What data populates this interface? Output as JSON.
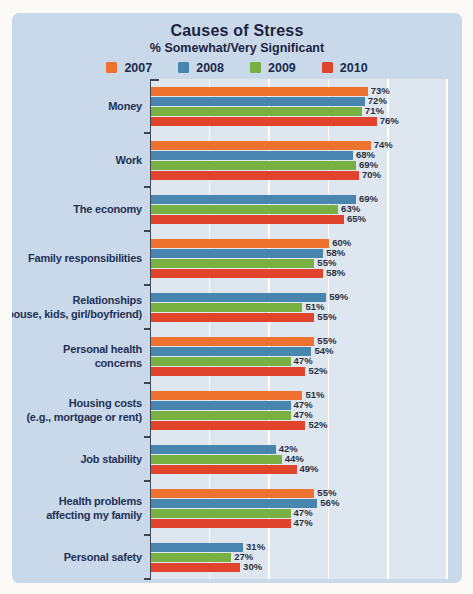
{
  "panel": {
    "background_color": "#c9d9ea",
    "plot_background_color": "#dee7f0"
  },
  "chart_data": {
    "type": "bar",
    "orientation": "horizontal",
    "title": "Causes of Stress",
    "subtitle": "% Somewhat/Very Significant",
    "legend_position": "top",
    "legend_entries": [
      "2007",
      "2008",
      "2009",
      "2010"
    ],
    "xlim": [
      0,
      100
    ],
    "gridline_interval_pct": 20,
    "grid": "on",
    "grid_color": "#ffffff",
    "axis_color": "#40454f",
    "value_suffix": "%",
    "series": [
      {
        "name": "2007",
        "color": "#EF712E"
      },
      {
        "name": "2008",
        "color": "#4986AF"
      },
      {
        "name": "2009",
        "color": "#78B042"
      },
      {
        "name": "2010",
        "color": "#E0442C"
      }
    ],
    "categories": [
      {
        "label": [
          "Money"
        ],
        "values": [
          73,
          72,
          71,
          76
        ]
      },
      {
        "label": [
          "Work"
        ],
        "values": [
          74,
          68,
          69,
          70
        ]
      },
      {
        "label": [
          "The economy"
        ],
        "values": [
          null,
          69,
          63,
          65
        ]
      },
      {
        "label": [
          "Family responsibilities"
        ],
        "values": [
          60,
          58,
          55,
          58
        ]
      },
      {
        "label": [
          "Relationships",
          "(spouse, kids, girl/boyfriend)"
        ],
        "values": [
          null,
          59,
          51,
          55
        ]
      },
      {
        "label": [
          "Personal health",
          "concerns"
        ],
        "values": [
          55,
          54,
          47,
          52
        ]
      },
      {
        "label": [
          "Housing costs",
          "(e.g., mortgage or rent)"
        ],
        "values": [
          51,
          47,
          47,
          52
        ]
      },
      {
        "label": [
          "Job stability"
        ],
        "values": [
          null,
          42,
          44,
          49
        ]
      },
      {
        "label": [
          "Health problems",
          "affecting my family"
        ],
        "values": [
          55,
          56,
          47,
          47
        ]
      },
      {
        "label": [
          "Personal safety"
        ],
        "values": [
          null,
          31,
          27,
          30
        ]
      }
    ]
  }
}
